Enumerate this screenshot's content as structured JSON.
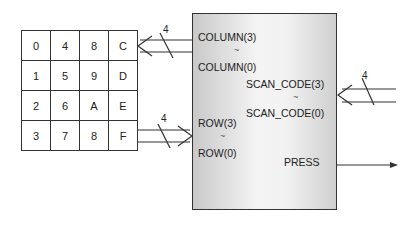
{
  "keypad": {
    "rows": [
      [
        "0",
        "4",
        "8",
        "C"
      ],
      [
        "1",
        "5",
        "9",
        "D"
      ],
      [
        "2",
        "6",
        "A",
        "E"
      ],
      [
        "3",
        "7",
        "8",
        "F"
      ]
    ]
  },
  "block": {
    "column_high": "COLUMN(3)",
    "column_low": "COLUMN(0)",
    "scan_high": "SCAN_CODE(3)",
    "scan_low": "SCAN_CODE(0)",
    "row_high": "ROW(3)",
    "row_low": "ROW(0)",
    "press": "PRESS",
    "range_glyph": "~"
  },
  "buses": {
    "column_width": "4",
    "row_width": "4",
    "scan_width": "4"
  }
}
